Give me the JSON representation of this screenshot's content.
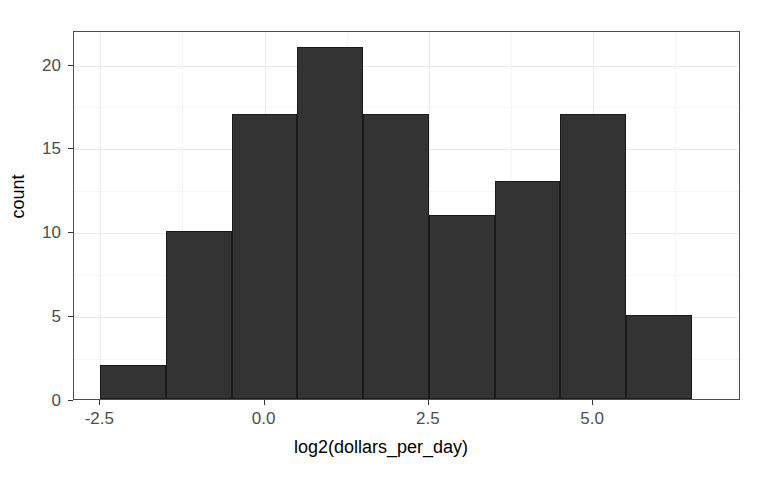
{
  "chart_data": {
    "type": "bar",
    "subtype": "histogram",
    "title": "",
    "xlabel": "log2(dollars_per_day)",
    "ylabel": "count",
    "xlim": [
      -2.9,
      7.25
    ],
    "ylim": [
      0,
      22.0
    ],
    "grid": true,
    "legend": null,
    "bin_width": 1.0,
    "bin_edges": [
      -2.5,
      -1.5,
      -0.5,
      0.5,
      1.5,
      2.5,
      3.5,
      4.5,
      5.5,
      6.5
    ],
    "bin_centers": [
      -2.0,
      -1.0,
      0.0,
      1.0,
      2.0,
      3.0,
      4.0,
      5.0,
      6.0
    ],
    "values": [
      2,
      10,
      17,
      21,
      17,
      11,
      13,
      17,
      5
    ],
    "total_count": 113,
    "bars": [
      {
        "label": "-2.5 to -1.5",
        "x0": -2.5,
        "x1": -1.5,
        "count": 2
      },
      {
        "label": "-1.5 to -0.5",
        "x0": -1.5,
        "x1": -0.5,
        "count": 10
      },
      {
        "label": "-0.5 to 0.5",
        "x0": -0.5,
        "x1": 0.5,
        "count": 17
      },
      {
        "label": "0.5 to 1.5",
        "x0": 0.5,
        "x1": 1.5,
        "count": 21
      },
      {
        "label": "1.5 to 2.5",
        "x0": 1.5,
        "x1": 2.5,
        "count": 17
      },
      {
        "label": "2.5 to 3.5",
        "x0": 2.5,
        "x1": 3.5,
        "count": 11
      },
      {
        "label": "3.5 to 4.5",
        "x0": 3.5,
        "x1": 4.5,
        "count": 13
      },
      {
        "label": "4.5 to 5.5",
        "x0": 4.5,
        "x1": 5.5,
        "count": 17
      },
      {
        "label": "5.5 to 6.5",
        "x0": 5.5,
        "x1": 6.5,
        "count": 5
      }
    ],
    "x_ticks": [
      {
        "value": -2.5,
        "label": "-2.5"
      },
      {
        "value": 0.0,
        "label": "0.0"
      },
      {
        "value": 2.5,
        "label": "2.5"
      },
      {
        "value": 5.0,
        "label": "5.0"
      }
    ],
    "y_ticks": [
      {
        "value": 0,
        "label": "0"
      },
      {
        "value": 5,
        "label": "5"
      },
      {
        "value": 10,
        "label": "10"
      },
      {
        "value": 15,
        "label": "15"
      },
      {
        "value": 20,
        "label": "20"
      }
    ],
    "x_minor_ticks": [
      -1.25,
      1.25,
      3.75,
      6.25
    ],
    "y_minor_ticks": [
      2.5,
      7.5,
      12.5,
      17.5
    ],
    "colors": {
      "bar_fill": "#333333",
      "bar_outline": "#1a1a1a",
      "panel_background": "#ffffff",
      "panel_border": "#4d4d4d",
      "major_gridline": "#ebebeb",
      "minor_gridline": "#f5f5f5",
      "axis_text": "#4d4d4d",
      "title_text": "#000000"
    }
  }
}
